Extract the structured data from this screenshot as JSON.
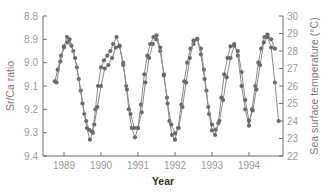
{
  "chart_data": {
    "type": "line",
    "title": "",
    "xlabel": "Year",
    "ylabel_left": "Sr/Ca ratio",
    "ylabel_right": "Sea surface temperature (°C)",
    "x_ticks": [
      "1989",
      "1990",
      "1991",
      "1992",
      "1993",
      "1994"
    ],
    "y_left_ticks": [
      "8.8",
      "8.9",
      "9.0",
      "9.1",
      "9.2",
      "9.3",
      "9.4"
    ],
    "y_left_range": [
      9.4,
      8.8
    ],
    "y_left_inverted": true,
    "y_right_ticks": [
      "22",
      "23",
      "24",
      "25",
      "26",
      "27",
      "28",
      "29",
      "30"
    ],
    "y_right_range": [
      22,
      30
    ],
    "grid": false,
    "legend": "none",
    "x_range": [
      1988.4,
      1994.9
    ],
    "series": [
      {
        "name": "Sr/Ca ratio",
        "axis": "left",
        "x": [
          1988.75,
          1988.83,
          1988.92,
          1989.0,
          1989.08,
          1989.15,
          1989.25,
          1989.35,
          1989.45,
          1989.55,
          1989.62,
          1989.7,
          1989.78,
          1989.85,
          1989.92,
          1990.0,
          1990.08,
          1990.17,
          1990.25,
          1990.33,
          1990.42,
          1990.5,
          1990.6,
          1990.68,
          1990.75,
          1990.83,
          1990.92,
          1991.0,
          1991.08,
          1991.17,
          1991.25,
          1991.33,
          1991.42,
          1991.5,
          1991.6,
          1991.7,
          1991.78,
          1991.85,
          1991.92,
          1992.0,
          1992.08,
          1992.17,
          1992.25,
          1992.33,
          1992.42,
          1992.5,
          1992.6,
          1992.7,
          1992.78,
          1992.85,
          1992.92,
          1993.0,
          1993.08,
          1993.17,
          1993.25,
          1993.33,
          1993.42,
          1993.5,
          1993.6,
          1993.7,
          1993.8,
          1993.9,
          1994.0,
          1994.08,
          1994.17,
          1994.25,
          1994.33,
          1994.42,
          1994.5,
          1994.6,
          1994.7
        ],
        "values": [
          9.08,
          9.03,
          8.97,
          8.93,
          8.89,
          8.9,
          8.95,
          9.02,
          9.12,
          9.22,
          9.28,
          9.33,
          9.3,
          9.2,
          9.1,
          9.02,
          8.99,
          8.97,
          8.95,
          8.92,
          8.89,
          8.93,
          9.0,
          9.1,
          9.2,
          9.28,
          9.32,
          9.28,
          9.18,
          9.05,
          8.97,
          8.92,
          8.89,
          8.9,
          8.95,
          9.05,
          9.15,
          9.25,
          9.31,
          9.33,
          9.28,
          9.18,
          9.08,
          9.0,
          8.94,
          8.92,
          8.9,
          8.94,
          9.03,
          9.12,
          9.22,
          9.29,
          9.31,
          9.26,
          9.15,
          9.05,
          8.98,
          8.93,
          8.92,
          8.97,
          9.1,
          9.2,
          9.27,
          9.2,
          9.1,
          9.0,
          8.94,
          8.89,
          8.88,
          8.9,
          8.94
        ]
      },
      {
        "name": "Sea surface temperature (°C)",
        "axis": "right",
        "x": [
          1988.8,
          1988.9,
          1989.0,
          1989.1,
          1989.2,
          1989.3,
          1989.4,
          1989.5,
          1989.6,
          1989.68,
          1989.75,
          1989.82,
          1989.9,
          1990.0,
          1990.1,
          1990.2,
          1990.3,
          1990.4,
          1990.5,
          1990.6,
          1990.7,
          1990.8,
          1990.9,
          1991.0,
          1991.1,
          1991.2,
          1991.3,
          1991.4,
          1991.5,
          1991.6,
          1991.7,
          1991.8,
          1991.9,
          1992.0,
          1992.1,
          1992.2,
          1992.3,
          1992.4,
          1992.5,
          1992.6,
          1992.7,
          1992.8,
          1992.9,
          1993.0,
          1993.1,
          1993.2,
          1993.3,
          1993.4,
          1993.5,
          1993.6,
          1993.7,
          1993.8,
          1993.9,
          1994.0,
          1994.1,
          1994.2,
          1994.3,
          1994.4,
          1994.5,
          1994.6,
          1994.7,
          1994.8
        ],
        "values": [
          26.2,
          27.4,
          28.2,
          28.5,
          28.3,
          27.6,
          26.4,
          25.0,
          24.0,
          23.5,
          23.4,
          23.8,
          24.8,
          26.0,
          27.0,
          27.2,
          27.6,
          28.2,
          28.3,
          27.2,
          25.8,
          24.4,
          23.6,
          23.6,
          24.5,
          26.2,
          27.6,
          28.4,
          28.9,
          28.2,
          26.6,
          25.0,
          23.8,
          23.3,
          23.6,
          24.8,
          26.2,
          27.6,
          28.6,
          28.7,
          27.8,
          26.4,
          24.8,
          23.8,
          23.5,
          24.0,
          25.2,
          26.5,
          27.6,
          28.3,
          28.0,
          26.8,
          25.2,
          24.0,
          24.6,
          25.8,
          27.2,
          28.5,
          28.8,
          28.2,
          26.2,
          24.0
        ]
      }
    ]
  }
}
